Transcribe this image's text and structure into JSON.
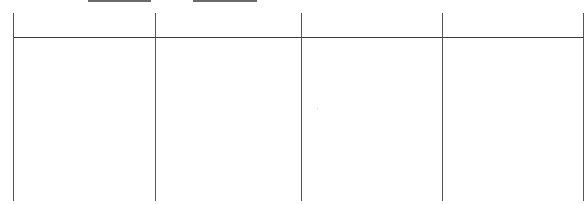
{
  "document": {
    "blank_fields": [
      {
        "label": "",
        "value": ""
      },
      {
        "label": "",
        "value": ""
      }
    ],
    "table": {
      "columns": [
        "",
        "",
        "",
        ""
      ],
      "rows": [
        [
          "",
          "",
          "",
          ""
        ]
      ]
    }
  },
  "colors": {
    "line": "#555555",
    "underline": "#6a6a6a",
    "background": "#ffffff"
  }
}
